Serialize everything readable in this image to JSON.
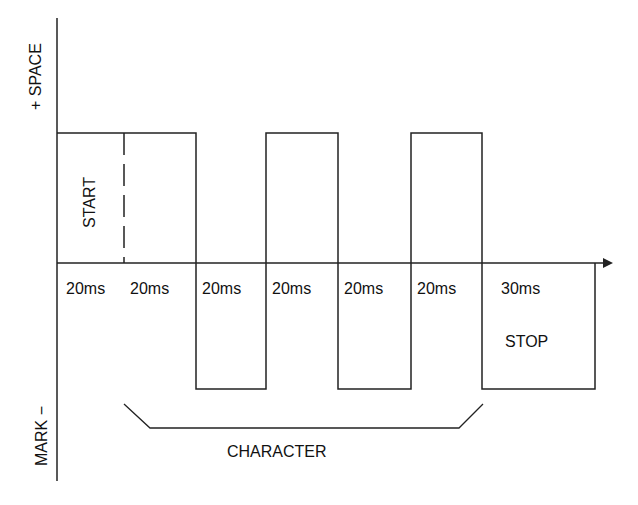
{
  "diagram": {
    "type": "serial-bit-timing",
    "axis_labels": {
      "top": "+ SPACE",
      "bottom": "MARK −"
    },
    "start_label": "START",
    "stop_label": "STOP",
    "character_label": "CHARACTER",
    "bits": [
      {
        "duration": "20ms",
        "level": "space"
      },
      {
        "duration": "20ms",
        "level": "space"
      },
      {
        "duration": "20ms",
        "level": "mark"
      },
      {
        "duration": "20ms",
        "level": "space"
      },
      {
        "duration": "20ms",
        "level": "mark"
      },
      {
        "duration": "20ms",
        "level": "space"
      },
      {
        "duration": "30ms",
        "level": "mark"
      }
    ],
    "colors": {
      "line": "#222222",
      "background": "#ffffff"
    }
  }
}
